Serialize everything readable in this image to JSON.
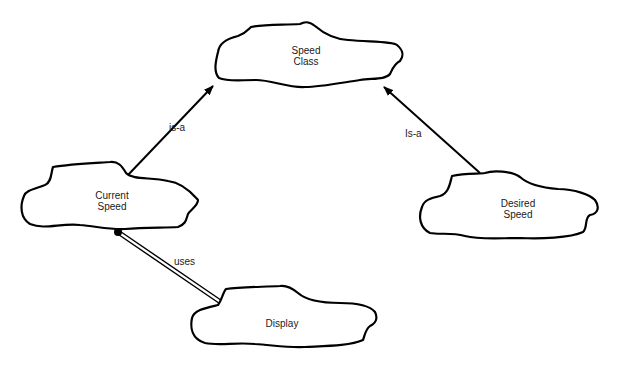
{
  "diagram": {
    "type": "Booch class diagram (cloud notation)",
    "colors": {
      "stroke": "#000000",
      "background": "#ffffff",
      "text": "#1a1a1a"
    },
    "nodes": [
      {
        "id": "speed_class",
        "line1": "Speed",
        "line2": "Class"
      },
      {
        "id": "current_speed",
        "line1": "Current",
        "line2": "Speed"
      },
      {
        "id": "desired_speed",
        "line1": "Desired",
        "line2": "Speed"
      },
      {
        "id": "display",
        "line1": "Display",
        "line2": ""
      }
    ],
    "edges": [
      {
        "from": "current_speed",
        "to": "speed_class",
        "label": "is-a",
        "kind": "inheritance-arrow"
      },
      {
        "from": "desired_speed",
        "to": "speed_class",
        "label": "Is-a",
        "kind": "inheritance-arrow"
      },
      {
        "from": "current_speed",
        "to": "display",
        "label": "uses",
        "kind": "using-relationship"
      }
    ]
  }
}
